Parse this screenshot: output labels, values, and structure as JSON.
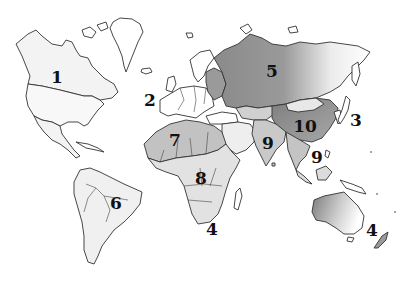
{
  "map": {
    "type": "world-map-regions",
    "style": "grayscale outline with shaded regions",
    "colors": {
      "background": "#ffffff",
      "land_light": "#f2f2f2",
      "land_mid": "#c8c8c8",
      "land_dark": "#8a8a8a",
      "outline": "#333333",
      "label": "#111111"
    },
    "labels": [
      {
        "id": "1",
        "text": "1",
        "region": "North America (Canada)",
        "x": 57,
        "y": 77
      },
      {
        "id": "2",
        "text": "2",
        "region": "North Atlantic Ocean",
        "x": 150,
        "y": 100
      },
      {
        "id": "5",
        "text": "5",
        "region": "Russia",
        "x": 272,
        "y": 71
      },
      {
        "id": "3",
        "text": "3",
        "region": "Japan / Pacific",
        "x": 356,
        "y": 120
      },
      {
        "id": "10",
        "text": "10",
        "region": "China",
        "x": 305,
        "y": 126
      },
      {
        "id": "7",
        "text": "7",
        "region": "North Africa",
        "x": 175,
        "y": 140
      },
      {
        "id": "9a",
        "text": "9",
        "region": "India",
        "x": 268,
        "y": 143
      },
      {
        "id": "9b",
        "text": "9",
        "region": "Southeast Asia",
        "x": 317,
        "y": 157
      },
      {
        "id": "8",
        "text": "8",
        "region": "Central Africa",
        "x": 201,
        "y": 178
      },
      {
        "id": "6",
        "text": "6",
        "region": "South America (Brazil)",
        "x": 116,
        "y": 203
      },
      {
        "id": "4a",
        "text": "4",
        "region": "Southern Africa / Indian Ocean",
        "x": 212,
        "y": 229
      },
      {
        "id": "4b",
        "text": "4",
        "region": "Australia / New Zealand",
        "x": 372,
        "y": 230
      }
    ]
  }
}
